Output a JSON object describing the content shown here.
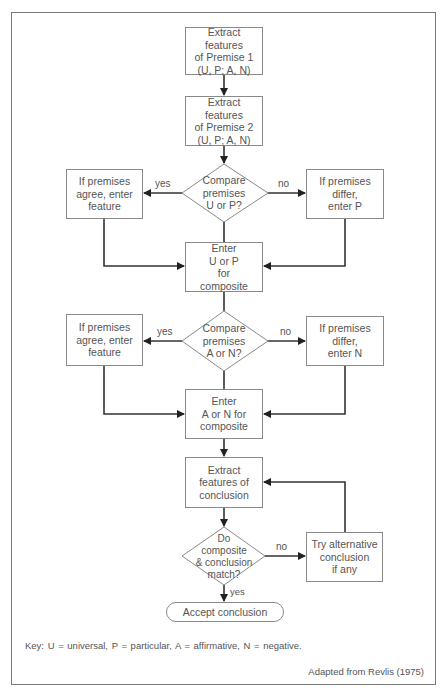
{
  "diagram": {
    "nodes": {
      "premise1": "Extract\nfeatures\nof Premise 1\n(U, P; A, N)",
      "premise2": "Extract\nfeatures\nof Premise 2\n(U, P; A, N)",
      "compare_up": "Compare\npremises\nU or P?",
      "agree_up": "If premises\nagree, enter\nfeature",
      "differ_up": "If premises\ndiffer,\nenter P",
      "enter_up": "Enter\nU or P\nfor\ncomposite",
      "compare_an": "Compare\npremises\nA or N?",
      "agree_an": "If premises\nagree, enter\nfeature",
      "differ_an": "If premises\ndiffer,\nenter N",
      "enter_an": "Enter\nA or N for\ncomposite",
      "extract_conclusion": "Extract\nfeatures of\nconclusion",
      "match": "Do\ncomposite\n& conclusion\nmatch?",
      "try_alternative": "Try alternative\nconclusion\nif any",
      "accept": "Accept  conclusion"
    },
    "edge_labels": {
      "up_yes": "yes",
      "up_no": "no",
      "an_yes": "yes",
      "an_no": "no",
      "match_no": "no",
      "match_yes": "yes"
    },
    "key": "Key: U = universal, P = particular, A = affirmative, N = negative.",
    "credit": "Adapted from Revlis (1975)",
    "colors": {
      "line": "#333333",
      "box_border": "#8a8a8a",
      "text": "#555555"
    }
  }
}
